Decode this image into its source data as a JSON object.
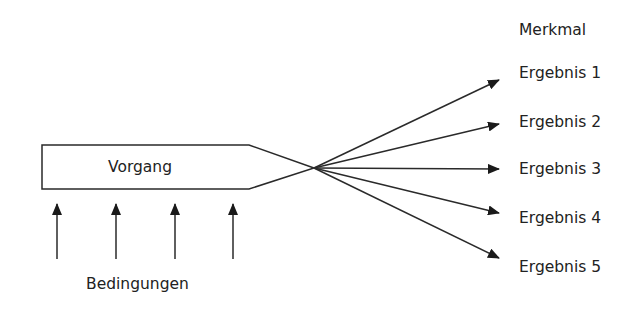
{
  "diagram": {
    "process": {
      "label": "Vorgang"
    },
    "conditions": {
      "label": "Bedingungen",
      "arrow_count": 4
    },
    "characteristic": {
      "label": "Merkmal"
    },
    "results": [
      {
        "label": "Ergebnis 1"
      },
      {
        "label": "Ergebnis 2"
      },
      {
        "label": "Ergebnis 3"
      },
      {
        "label": "Ergebnis 4"
      },
      {
        "label": "Ergebnis 5"
      }
    ],
    "colors": {
      "line": "#2a2a2a",
      "text": "#222222",
      "background": "#ffffff"
    }
  }
}
